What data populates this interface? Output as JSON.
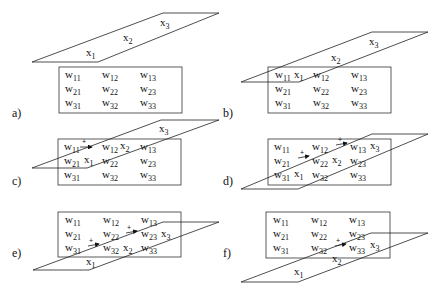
{
  "panels": [
    {
      "id": "a",
      "label": "a)"
    },
    {
      "id": "b",
      "label": "b)"
    },
    {
      "id": "c",
      "label": "c)"
    },
    {
      "id": "d",
      "label": "d)"
    },
    {
      "id": "e",
      "label": "e)"
    },
    {
      "id": "f",
      "label": "f)"
    }
  ],
  "matrix": {
    "symbol": "w",
    "cells": [
      [
        "11",
        "12",
        "13"
      ],
      [
        "21",
        "22",
        "23"
      ],
      [
        "31",
        "32",
        "33"
      ]
    ]
  },
  "vector": {
    "symbol": "x",
    "entries": [
      "1",
      "2",
      "3"
    ]
  },
  "accumulate_symbol": "+"
}
